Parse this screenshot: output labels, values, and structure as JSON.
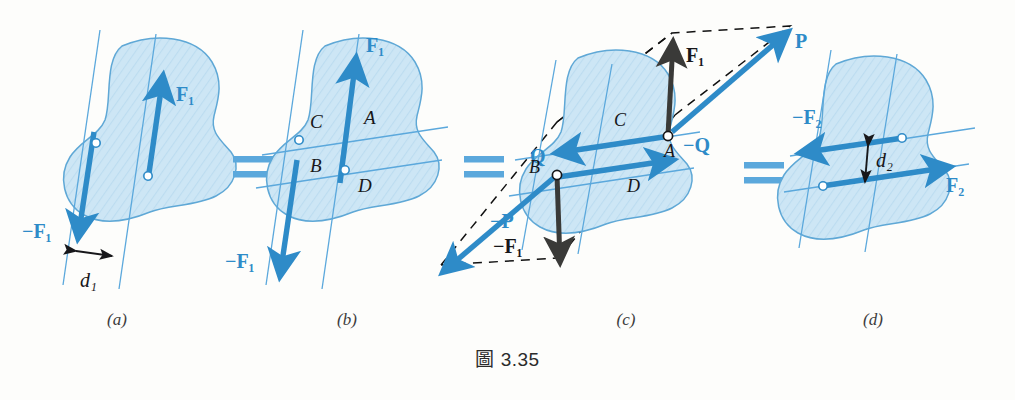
{
  "figure": {
    "caption": "圖 3.35",
    "background_color": "#fdfdfb",
    "colors": {
      "blue_vector": "#2E8BC8",
      "blue_light": "#5BA8DC",
      "blob_fill": "#C9E4F4",
      "blob_stroke": "#5FA8D6",
      "line_blue": "#5BA8DC",
      "dark_arrow": "#3A3A38",
      "black_text": "#1d1d1b",
      "dashed": "#111111"
    },
    "panels": [
      {
        "id": "a",
        "label": "(a)",
        "vectors": [
          {
            "name": "F1",
            "label": "F₁",
            "label_color": "blue",
            "direction": "up-right"
          },
          {
            "name": "-F1",
            "label": "−F₁",
            "label_color": "blue",
            "direction": "down-left"
          }
        ],
        "dimensions": [
          {
            "name": "d1",
            "label": "d₁",
            "label_color": "black"
          }
        ],
        "points": 2
      },
      {
        "id": "b",
        "label": "(b)",
        "vectors": [
          {
            "name": "F1",
            "label": "F₁",
            "label_color": "blue",
            "direction": "up-right"
          },
          {
            "name": "-F1",
            "label": "−F₁",
            "label_color": "blue",
            "direction": "down-left"
          }
        ],
        "points_labels": [
          "A",
          "B",
          "C",
          "D"
        ],
        "points": 2
      },
      {
        "id": "c",
        "label": "(c)",
        "vectors": [
          {
            "name": "F1",
            "label": "F₁",
            "label_color": "black",
            "direction": "up"
          },
          {
            "name": "-F1",
            "label": "−F₁",
            "label_color": "black",
            "direction": "down"
          },
          {
            "name": "P",
            "label": "P",
            "label_color": "blue",
            "direction": "up-right"
          },
          {
            "name": "-P",
            "label": "−P",
            "label_color": "blue",
            "direction": "down-left"
          },
          {
            "name": "Q",
            "label": "Q",
            "label_color": "blue",
            "direction": "left"
          },
          {
            "name": "-Q",
            "label": "−Q",
            "label_color": "blue",
            "direction": "right"
          }
        ],
        "points_labels": [
          "A",
          "B",
          "C",
          "D"
        ],
        "parallelogram": "dashed",
        "points": 2
      },
      {
        "id": "d",
        "label": "(d)",
        "vectors": [
          {
            "name": "F2",
            "label": "F₂",
            "label_color": "blue",
            "direction": "right"
          },
          {
            "name": "-F2",
            "label": "−F₂",
            "label_color": "blue",
            "direction": "left"
          }
        ],
        "dimensions": [
          {
            "name": "d2",
            "label": "d₂",
            "label_color": "black"
          }
        ],
        "points": 2
      }
    ],
    "equals_signs": [
      "=",
      "=",
      "="
    ]
  }
}
